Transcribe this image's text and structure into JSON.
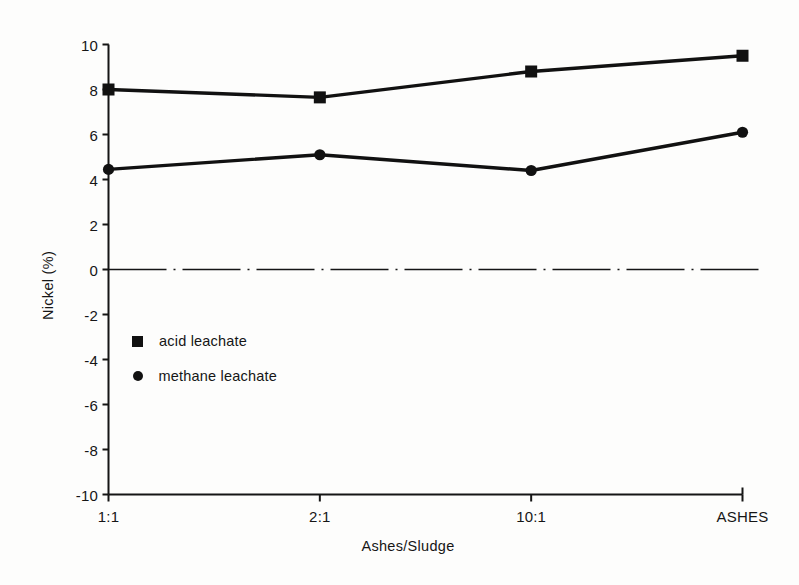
{
  "chart_data": {
    "type": "line",
    "title": "",
    "subtitle": "",
    "xlabel": "Ashes/Sludge",
    "ylabel": "Nickel (%)",
    "categories": [
      "1:1",
      "2:1",
      "10:1",
      "ASHES"
    ],
    "ylim": [
      -10,
      10
    ],
    "ytick_labels": [
      "10",
      "8",
      "6",
      "4",
      "2",
      "0",
      "-2",
      "-4",
      "-6",
      "-8",
      "-10"
    ],
    "ytick_values": [
      10,
      8,
      6,
      4,
      2,
      0,
      -2,
      -4,
      -6,
      -8,
      -10
    ],
    "grid": false,
    "zero_line": "dash-dot",
    "legend_position": "inside-left-lower",
    "series": [
      {
        "name": "acid leachate",
        "marker": "square",
        "color": "#111111",
        "values": [
          8.0,
          7.65,
          8.8,
          9.5
        ]
      },
      {
        "name": "methane leachate",
        "marker": "circle",
        "color": "#111111",
        "values": [
          4.45,
          5.1,
          4.4,
          6.1
        ]
      }
    ]
  },
  "axes": {
    "y_title": "Nickel (%)",
    "x_title": "Ashes/Sludge"
  },
  "legend": {
    "items": [
      {
        "label": "acid leachate",
        "marker": "square-marker"
      },
      {
        "label": "methane leachate",
        "marker": "circle-marker"
      }
    ]
  }
}
